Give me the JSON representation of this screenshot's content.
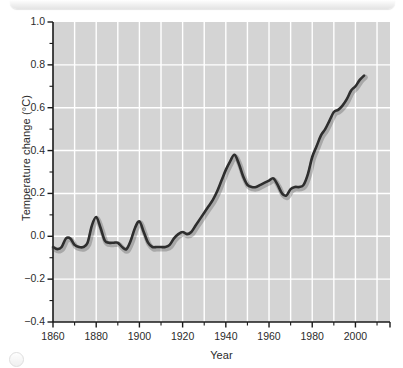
{
  "figure": {
    "background_color": "#ffffff",
    "plot_background_color": "#d4d4d4",
    "grid_color": "#ffffff",
    "axis_color": "#1a1a1a",
    "line_color": "#2e2e2e"
  },
  "decor": {
    "top_bar_name": "top-rounded-bar",
    "corner_mark_name": "corner-circle-mark"
  },
  "chart_data": {
    "type": "line",
    "title": "",
    "xlabel": "Year",
    "ylabel": "Temperature change (°C)",
    "xlim": [
      1860,
      2016
    ],
    "ylim": [
      -0.4,
      1.0
    ],
    "grid": true,
    "legend": "none",
    "xticks": [
      1860,
      1880,
      1900,
      1920,
      1940,
      1960,
      1980,
      2000
    ],
    "xtick_labels": [
      "1860",
      "1880",
      "1900",
      "1920",
      "1940",
      "1960",
      "1980",
      "2000"
    ],
    "x_minor_ticks": [
      1870,
      1890,
      1910,
      1930,
      1950,
      1970,
      1990,
      2010
    ],
    "yticks": [
      -0.4,
      -0.2,
      0.0,
      0.2,
      0.4,
      0.6,
      0.8,
      1.0
    ],
    "ytick_labels": [
      "−0.4",
      "−0.2",
      "0.0",
      "0.2",
      "0.4",
      "0.6",
      "0.8",
      "1.0"
    ],
    "y_minor_ticks": [
      -0.3,
      -0.1,
      0.1,
      0.3,
      0.5,
      0.7,
      0.9
    ],
    "x_gridlines": [
      1870,
      1880,
      1890,
      1900,
      1910,
      1920,
      1930,
      1940,
      1950,
      1960,
      1970,
      1980,
      1990,
      2000,
      2010
    ],
    "y_gridlines": [
      -0.2,
      0.0,
      0.2,
      0.4,
      0.6,
      0.8
    ],
    "series": [
      {
        "name": "Global temperature change",
        "x": [
          1860,
          1862,
          1864,
          1866,
          1868,
          1870,
          1872,
          1874,
          1876,
          1878,
          1880,
          1882,
          1884,
          1886,
          1888,
          1890,
          1892,
          1894,
          1896,
          1898,
          1900,
          1902,
          1904,
          1906,
          1908,
          1910,
          1912,
          1914,
          1916,
          1918,
          1920,
          1922,
          1924,
          1926,
          1928,
          1930,
          1932,
          1934,
          1936,
          1938,
          1940,
          1942,
          1944,
          1946,
          1948,
          1950,
          1952,
          1954,
          1956,
          1958,
          1960,
          1962,
          1964,
          1966,
          1968,
          1970,
          1972,
          1974,
          1976,
          1978,
          1980,
          1982,
          1984,
          1986,
          1988,
          1990,
          1992,
          1994,
          1996,
          1998,
          2000,
          2002,
          2004
        ],
        "values": [
          -0.05,
          -0.06,
          -0.05,
          -0.01,
          -0.01,
          -0.04,
          -0.05,
          -0.05,
          -0.03,
          0.05,
          0.09,
          0.04,
          -0.02,
          -0.03,
          -0.03,
          -0.03,
          -0.05,
          -0.06,
          -0.02,
          0.04,
          0.07,
          0.02,
          -0.03,
          -0.05,
          -0.05,
          -0.05,
          -0.05,
          -0.04,
          -0.01,
          0.01,
          0.02,
          0.01,
          0.02,
          0.05,
          0.08,
          0.11,
          0.14,
          0.17,
          0.21,
          0.26,
          0.31,
          0.35,
          0.38,
          0.34,
          0.28,
          0.24,
          0.23,
          0.23,
          0.24,
          0.25,
          0.26,
          0.27,
          0.24,
          0.2,
          0.19,
          0.22,
          0.23,
          0.23,
          0.24,
          0.29,
          0.37,
          0.42,
          0.47,
          0.5,
          0.54,
          0.58,
          0.59,
          0.61,
          0.64,
          0.68,
          0.7,
          0.73,
          0.75
        ]
      }
    ]
  }
}
